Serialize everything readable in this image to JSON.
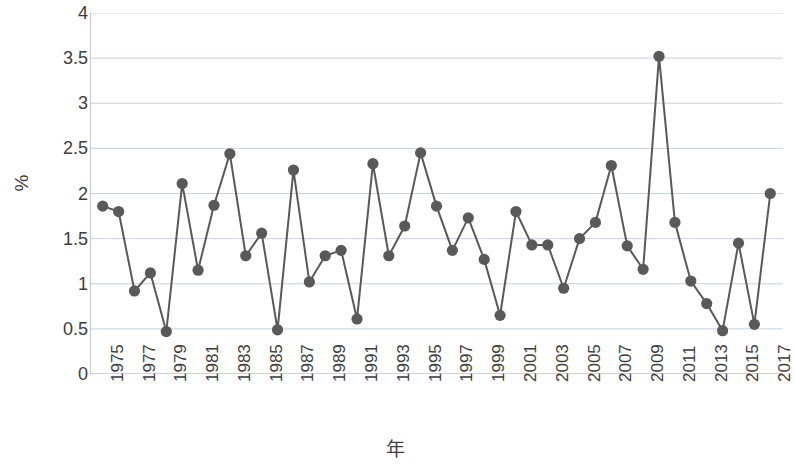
{
  "chart_data": {
    "type": "line",
    "title": "",
    "subtitle": "",
    "xlabel": "年",
    "ylabel": "%",
    "xlim": [
      1974.2,
      2017.8
    ],
    "ylim": [
      0,
      4
    ],
    "ytick_step": 0.5,
    "yticks": [
      "4",
      "3.5",
      "3",
      "2.5",
      "2",
      "1.5",
      "1",
      "0.5",
      "0"
    ],
    "ytick_values": [
      4,
      3.5,
      3,
      2.5,
      2,
      1.5,
      1,
      0.5,
      0
    ],
    "xticks": [
      "1975",
      "1977",
      "1979",
      "1981",
      "1983",
      "1985",
      "1987",
      "1989",
      "1991",
      "1993",
      "1995",
      "1997",
      "1999",
      "2001",
      "2003",
      "2005",
      "2007",
      "2009",
      "2011",
      "2013",
      "2015",
      "2017"
    ],
    "xtick_values": [
      1975,
      1977,
      1979,
      1981,
      1983,
      1985,
      1987,
      1989,
      1991,
      1993,
      1995,
      1997,
      1999,
      2001,
      2003,
      2005,
      2007,
      2009,
      2011,
      2013,
      2015,
      2017
    ],
    "grid": "horizontal",
    "legend": "none",
    "marker": "circle",
    "marker_color": "#595959",
    "line_color": "#595959",
    "grid_color": "#c6d3e3",
    "axis_color": "#a6a6a6",
    "x": [
      1975,
      1976,
      1977,
      1978,
      1979,
      1980,
      1981,
      1982,
      1983,
      1984,
      1985,
      1986,
      1987,
      1988,
      1989,
      1990,
      1991,
      1992,
      1993,
      1994,
      1995,
      1996,
      1997,
      1998,
      1999,
      2000,
      2001,
      2002,
      2003,
      2004,
      2005,
      2006,
      2007,
      2008,
      2009,
      2010,
      2011,
      2012,
      2013,
      2014,
      2015,
      2016,
      2017
    ],
    "values": [
      1.86,
      1.8,
      0.92,
      1.12,
      0.47,
      2.11,
      1.15,
      1.87,
      2.44,
      1.31,
      1.56,
      0.49,
      2.26,
      1.02,
      1.31,
      1.37,
      0.61,
      2.33,
      1.31,
      1.64,
      2.45,
      1.86,
      1.37,
      1.73,
      1.27,
      0.65,
      1.8,
      1.43,
      1.43,
      0.95,
      1.5,
      1.68,
      2.31,
      1.42,
      1.16,
      3.52,
      1.68,
      1.03,
      0.78,
      0.48,
      1.45,
      0.55,
      2.0
    ],
    "series": [
      {
        "name": "",
        "values": [
          1.86,
          1.8,
          0.92,
          1.12,
          0.47,
          2.11,
          1.15,
          1.87,
          2.44,
          1.31,
          1.56,
          0.49,
          2.26,
          1.02,
          1.31,
          1.37,
          0.61,
          2.33,
          1.31,
          1.64,
          2.45,
          1.86,
          1.37,
          1.73,
          1.27,
          0.65,
          1.8,
          1.43,
          1.43,
          0.95,
          1.5,
          1.68,
          2.31,
          1.42,
          1.16,
          3.52,
          1.68,
          1.03,
          0.78,
          0.48,
          1.45,
          0.55,
          2.0
        ]
      }
    ]
  }
}
